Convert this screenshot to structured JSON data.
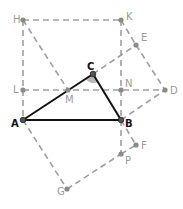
{
  "diagram": {
    "title": "",
    "points": {
      "H": {
        "label": "H",
        "x": 23,
        "y": 20,
        "main": false,
        "lx": -10,
        "ly": 3
      },
      "K": {
        "label": "K",
        "x": 121,
        "y": 20,
        "main": false,
        "lx": 5,
        "ly": 0
      },
      "E": {
        "label": "E",
        "x": 136,
        "y": 45,
        "main": false,
        "lx": 5,
        "ly": -4
      },
      "C": {
        "label": "C",
        "x": 93,
        "y": 74,
        "main": true,
        "lx": -6,
        "ly": -4
      },
      "L": {
        "label": "L",
        "x": 23,
        "y": 90,
        "main": false,
        "lx": -10,
        "ly": 3
      },
      "M": {
        "label": "M",
        "x": 68,
        "y": 90,
        "main": false,
        "lx": -3,
        "ly": 13
      },
      "N": {
        "label": "N",
        "x": 121,
        "y": 90,
        "main": false,
        "lx": 4,
        "ly": -3
      },
      "D": {
        "label": "D",
        "x": 165,
        "y": 90,
        "main": false,
        "lx": 5,
        "ly": 4
      },
      "A": {
        "label": "A",
        "x": 23,
        "y": 120,
        "main": true,
        "lx": -12,
        "ly": 7
      },
      "B": {
        "label": "B",
        "x": 121,
        "y": 120,
        "main": true,
        "lx": 4,
        "ly": 7
      },
      "F": {
        "label": "F",
        "x": 136,
        "y": 145,
        "main": false,
        "lx": 5,
        "ly": 4
      },
      "P": {
        "label": "P",
        "x": 121,
        "y": 154,
        "main": false,
        "lx": 4,
        "ly": 10
      },
      "G": {
        "label": "G",
        "x": 67,
        "y": 189,
        "main": false,
        "lx": -10,
        "ly": 6
      }
    },
    "solid_segments": [
      [
        "A",
        "B"
      ],
      [
        "B",
        "C"
      ],
      [
        "C",
        "A"
      ]
    ],
    "dashed_segments": [
      [
        "H",
        "K"
      ],
      [
        "H",
        "L"
      ],
      [
        "L",
        "A"
      ],
      [
        "K",
        "N"
      ],
      [
        "N",
        "B"
      ],
      [
        "B",
        "P"
      ],
      [
        "L",
        "D"
      ],
      [
        "H",
        "M"
      ],
      [
        "C",
        "E"
      ],
      [
        "K",
        "E"
      ],
      [
        "E",
        "D"
      ],
      [
        "B",
        "D"
      ],
      [
        "A",
        "G"
      ],
      [
        "G",
        "P"
      ],
      [
        "P",
        "F"
      ],
      [
        "B",
        "F"
      ]
    ],
    "angle_marker": {
      "vertex": "C",
      "from": "A",
      "to": "B",
      "radius": 9,
      "color": "#b8b8b8"
    },
    "colors": {
      "dashed": "#9e9e9e",
      "solid": "#111111",
      "label_main": "#111111",
      "label_secondary": "#9a9a9a"
    }
  }
}
